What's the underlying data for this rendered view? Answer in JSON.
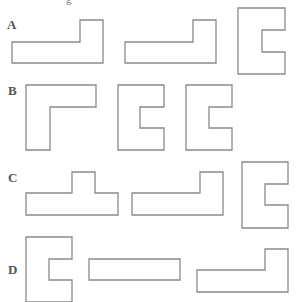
{
  "figure": {
    "cropped_top_text": "g",
    "stroke_color": "#8a8a8a",
    "label_color": "#555555",
    "rows": [
      {
        "label": "A",
        "label_pos": [
          7,
          29
        ],
        "shapes": [
          {
            "kind": "L-shape",
            "points": "12,42 80,42 80,20 103,20 103,63 12,63"
          },
          {
            "kind": "L-shape",
            "points": "125,42 193,42 193,20 216,20 216,63 125,63"
          },
          {
            "kind": "C-shape",
            "points": "238,8 285,8 285,30 262,30 262,52 285,52 285,74 238,74"
          }
        ]
      },
      {
        "label": "B",
        "label_pos": [
          8,
          95
        ],
        "shapes": [
          {
            "kind": "L-shape",
            "points": "26,85 96,85 96,107 50,107 50,150 26,150"
          },
          {
            "kind": "C-shape",
            "points": "118,85 164,85 164,107 140,107 140,128 164,128 164,150 118,150"
          },
          {
            "kind": "C-shape",
            "points": "186,85 232,85 232,107 209,107 209,128 232,128 232,150 186,150"
          }
        ]
      },
      {
        "label": "C",
        "label_pos": [
          8,
          182
        ],
        "shapes": [
          {
            "kind": "T-shape",
            "points": "26,193 72,193 72,172 95,172 95,193 118,193 118,215 26,215"
          },
          {
            "kind": "L-shape",
            "points": "132,193 200,193 200,172 223,172 223,215 132,215"
          },
          {
            "kind": "C-shape",
            "points": "242,162 288,162 288,184 265,184 265,205 288,205 288,228 242,228"
          }
        ]
      },
      {
        "label": "D",
        "label_pos": [
          8,
          274
        ],
        "shapes": [
          {
            "kind": "C-shape",
            "points": "26,237 72,237 72,259 49,259 49,280 72,280 72,302 26,302"
          },
          {
            "kind": "rectangle",
            "points": "89,259 180,259 180,280 89,280"
          },
          {
            "kind": "L-shape",
            "points": "197,270 265,270 265,249 288,249 288,292 197,292"
          }
        ]
      }
    ]
  }
}
